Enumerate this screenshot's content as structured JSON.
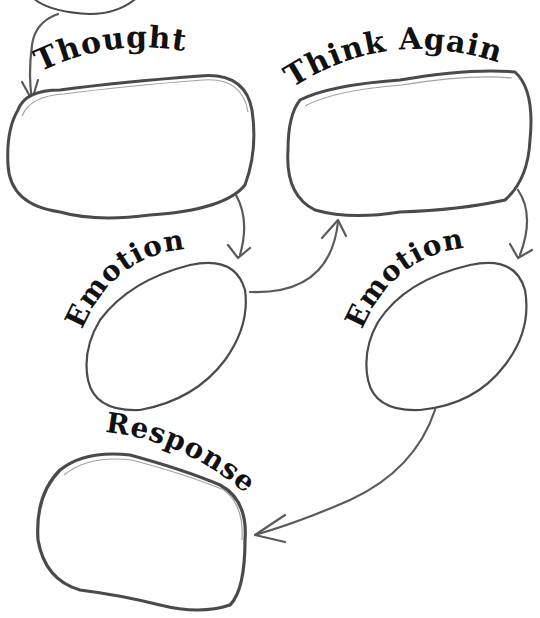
{
  "diagram": {
    "type": "cognitive-flow-worksheet",
    "colors": {
      "background": "#ffffff",
      "outline": "#4a4a4a",
      "arrow": "#5a5a5a",
      "text": "#111111"
    },
    "nodes": [
      {
        "id": "thought",
        "label": "Thought",
        "content": ""
      },
      {
        "id": "think_again",
        "label": "Think Again",
        "content": ""
      },
      {
        "id": "emotion_left",
        "label": "Emotion",
        "content": ""
      },
      {
        "id": "emotion_right",
        "label": "Emotion",
        "content": ""
      },
      {
        "id": "response",
        "label": "Response",
        "content": ""
      }
    ],
    "edges": [
      {
        "from": "previous",
        "to": "thought"
      },
      {
        "from": "thought",
        "to": "emotion_left"
      },
      {
        "from": "emotion_left",
        "to": "think_again"
      },
      {
        "from": "think_again",
        "to": "emotion_right"
      },
      {
        "from": "emotion_right",
        "to": "response"
      }
    ]
  }
}
